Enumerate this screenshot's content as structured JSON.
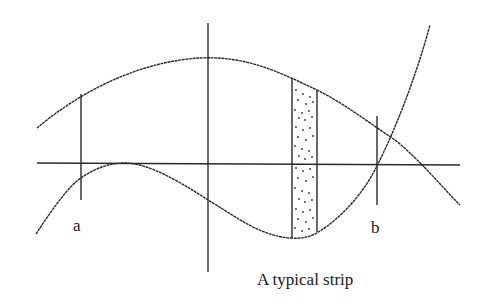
{
  "diagram": {
    "labels": {
      "a": "a",
      "b": "b",
      "caption": "A typical strip"
    },
    "colors": {
      "stroke": "#2a2a2a",
      "background": "#ffffff",
      "strip_dots": "#333333"
    },
    "elements": {
      "x_axis": {
        "x1": 37,
        "y1": 163,
        "x2": 460,
        "y2": 165
      },
      "y_axis": {
        "x1": 208,
        "y1": 23,
        "x2": 208,
        "y2": 272
      },
      "bound_a": {
        "x": 81,
        "y_top": 94,
        "y_bottom": 200
      },
      "bound_b": {
        "x": 377,
        "y_top": 116,
        "y_bottom": 205
      },
      "strip": {
        "x_left": 292,
        "x_right": 317,
        "y_top_left": 78,
        "y_top_right": 90,
        "y_bottom": 238
      },
      "upper_curve": "top concave-down curve",
      "lower_curve": "lower cubic-like curve"
    }
  }
}
